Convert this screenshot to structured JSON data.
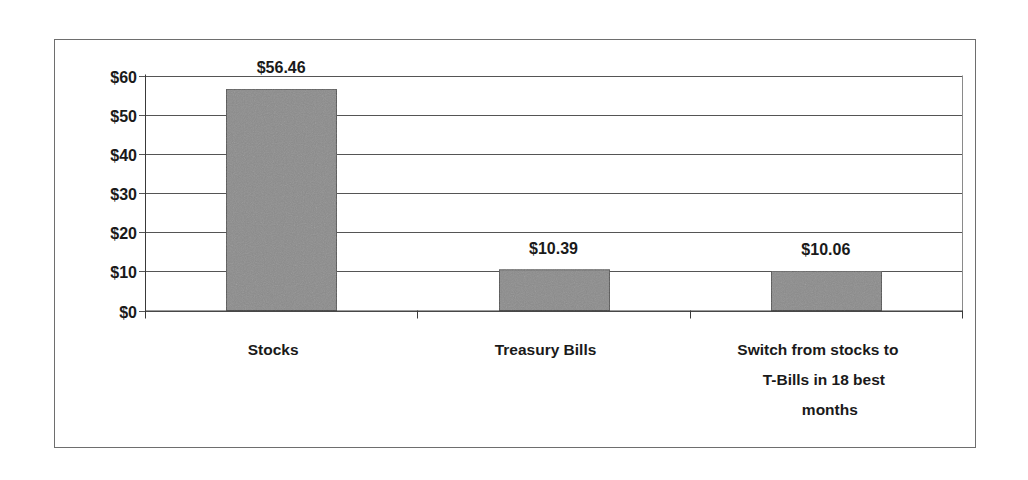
{
  "chart_data": {
    "type": "bar",
    "title": "",
    "xlabel": "",
    "ylabel": "",
    "categories": [
      "Stocks",
      "Treasury Bills",
      "Switch from stocks to T-Bills in 18 best months"
    ],
    "category_label_lines": [
      [
        "Stocks"
      ],
      [
        "Treasury Bills"
      ],
      [
        "Switch from stocks to",
        "T-Bills in 18 best",
        "months"
      ]
    ],
    "values": [
      56.46,
      10.39,
      10.06
    ],
    "data_labels": [
      "$56.46",
      "$10.39",
      "$10.06"
    ],
    "ylim": [
      0,
      60
    ],
    "yticks": [
      0,
      10,
      20,
      30,
      40,
      50,
      60
    ],
    "ytick_labels": [
      "$0",
      "$10",
      "$20",
      "$30",
      "$40",
      "$50",
      "$60"
    ],
    "grid": true,
    "legend": null,
    "colors": {
      "bar": "#8c8c8c",
      "bar_border": "#555555",
      "grid": "#555555",
      "frame": "#6e6e6e"
    }
  }
}
